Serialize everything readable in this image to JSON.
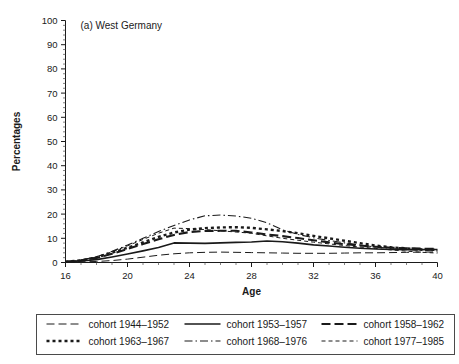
{
  "figure": {
    "panel_title": "(a) West Germany",
    "background": "#ffffff",
    "ink_color": "#1a1a1a"
  },
  "axes": {
    "y_title": "Percentages",
    "x_title": "Age",
    "y_ticks": [
      "0",
      "10",
      "20",
      "30",
      "40",
      "50",
      "60",
      "70",
      "80",
      "90",
      "100"
    ],
    "x_ticks": [
      "16",
      "20",
      "24",
      "28",
      "32",
      "36",
      "40"
    ]
  },
  "legend": {
    "entries": [
      {
        "label": "cohort 1944–1952",
        "dash": "long-dash"
      },
      {
        "label": "cohort 1953–1957",
        "dash": "solid"
      },
      {
        "label": "cohort 1958–1962",
        "dash": "bold-dash"
      },
      {
        "label": "cohort 1963–1967",
        "dash": "dotted-square"
      },
      {
        "label": "cohort 1968–1976",
        "dash": "dash-dot"
      },
      {
        "label": "cohort 1977–1985",
        "dash": "short-dash"
      }
    ]
  },
  "chart_data": {
    "type": "line",
    "title": "(a) West Germany",
    "xlabel": "Age",
    "ylabel": "Percentages",
    "xlim": [
      16,
      40
    ],
    "ylim": [
      0,
      100
    ],
    "xticks": [
      16,
      20,
      24,
      28,
      32,
      36,
      40
    ],
    "yticks": [
      0,
      10,
      20,
      30,
      40,
      50,
      60,
      70,
      80,
      90,
      100
    ],
    "grid": false,
    "legend_position": "below-axes",
    "x": [
      16,
      17,
      18,
      19,
      20,
      21,
      22,
      23,
      24,
      25,
      26,
      27,
      28,
      29,
      30,
      31,
      32,
      33,
      34,
      35,
      36,
      37,
      38,
      39,
      40
    ],
    "series": [
      {
        "name": "cohort 1944–1952",
        "dash": "long-dash",
        "width": 1,
        "values": [
          0.2,
          0.3,
          0.4,
          0.8,
          1.4,
          2.2,
          3.0,
          3.6,
          4.0,
          4.2,
          4.3,
          4.2,
          4.1,
          4.0,
          3.9,
          3.8,
          3.8,
          3.8,
          3.9,
          4.0,
          4.0,
          4.1,
          4.2,
          4.3,
          4.3
        ]
      },
      {
        "name": "cohort 1953–1957",
        "dash": "solid",
        "width": 1.6,
        "values": [
          0.3,
          0.6,
          1.2,
          2.3,
          3.5,
          4.8,
          6.2,
          8.1,
          8.0,
          7.9,
          8.1,
          8.3,
          8.5,
          8.9,
          8.6,
          8.0,
          7.3,
          6.8,
          6.3,
          5.9,
          5.6,
          5.4,
          5.3,
          5.3,
          5.4
        ]
      },
      {
        "name": "cohort 1958–1962",
        "dash": "bold-dash",
        "width": 2.1,
        "values": [
          0.3,
          0.8,
          1.9,
          3.6,
          5.6,
          7.6,
          9.6,
          11.4,
          12.6,
          13.0,
          13.1,
          13.1,
          12.4,
          11.6,
          10.9,
          10.1,
          9.2,
          8.3,
          7.6,
          7.0,
          6.5,
          6.1,
          5.9,
          5.7,
          5.6
        ]
      },
      {
        "name": "cohort 1963–1967",
        "dash": "dotted-square",
        "width": 2.4,
        "values": [
          0.3,
          0.9,
          2.1,
          4.0,
          6.1,
          8.3,
          10.6,
          12.4,
          13.6,
          14.2,
          14.5,
          14.6,
          14.3,
          13.7,
          13.0,
          12.1,
          11.0,
          10.0,
          9.0,
          8.0,
          7.0,
          6.3,
          5.8,
          5.4,
          5.2
        ]
      },
      {
        "name": "cohort 1968–1976",
        "dash": "dash-dot",
        "width": 1.1,
        "values": [
          0.3,
          1.0,
          2.4,
          4.6,
          7.2,
          10.0,
          12.8,
          15.3,
          17.6,
          19.3,
          19.6,
          19.2,
          18.3,
          16.4,
          13.5,
          11.6,
          10.2,
          9.1,
          8.1,
          7.2,
          6.4,
          5.8,
          5.3,
          5.0,
          4.8
        ]
      },
      {
        "name": "cohort 1977–1985",
        "dash": "short-dash",
        "width": 1,
        "values": [
          0.3,
          1.0,
          2.3,
          4.4,
          6.9,
          9.5,
          12.1,
          14.2,
          14.0,
          13.6,
          13.1,
          12.6,
          12.1,
          11.0,
          10.0,
          9.2,
          8.4,
          7.7,
          7.0,
          6.4,
          5.8,
          5.2,
          4.7,
          4.2,
          3.9
        ]
      }
    ]
  }
}
